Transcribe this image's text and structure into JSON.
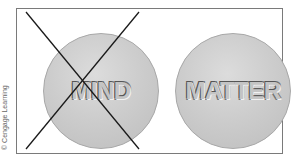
{
  "diagram": {
    "left_panel": {
      "label": "MIND",
      "crossed_out": true
    },
    "right_panel": {
      "label": "MATTER",
      "crossed_out": false
    },
    "credit": "© Cengage Learning"
  },
  "colors": {
    "frame": "#7a7a7a",
    "circle_fill": "#cdcdcd",
    "cross_line": "#1a1a1a"
  }
}
